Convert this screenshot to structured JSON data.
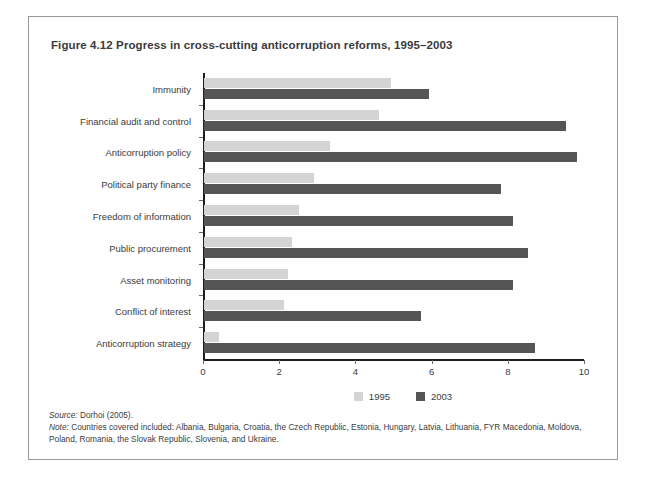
{
  "figure": {
    "title": "Figure 4.12  Progress in cross-cutting anticorruption reforms, 1995–2003",
    "source": "Source:",
    "source_text": " Dorhoi (2005).",
    "note": "Note:",
    "note_text": " Countries covered included: Albania, Bulgaria, Croatia, the Czech Republic, Estonia, Hungary, Latvia, Lithuania, FYR Macedonia, Moldova, Poland, Romania, the Slovak Republic, Slovenia, and Ukraine."
  },
  "colors": {
    "series_1995": "#d4d4d4",
    "series_2003": "#555555",
    "axis": "#1d1d1d",
    "border": "#9a9a9a",
    "text": "#3b3b3b"
  },
  "chart_data": {
    "type": "bar",
    "orientation": "horizontal",
    "title": "Figure 4.12  Progress in cross-cutting anticorruption reforms, 1995–2003",
    "xlabel": "",
    "ylabel": "",
    "xlim": [
      0,
      10
    ],
    "xticks": [
      0,
      2,
      4,
      6,
      8,
      10
    ],
    "xtick_labels": [
      "0",
      "2",
      "4",
      "6",
      "8",
      "10"
    ],
    "grid": false,
    "legend_position": "bottom-center",
    "categories": [
      "Immunity",
      "Financial audit and control",
      "Anticorruption policy",
      "Political party finance",
      "Freedom of information",
      "Public procurement",
      "Asset monitoring",
      "Conflict of interest",
      "Anticorruption strategy"
    ],
    "series": [
      {
        "name": "1995",
        "color": "#d4d4d4",
        "values": [
          4.9,
          4.6,
          3.3,
          2.9,
          2.5,
          2.3,
          2.2,
          2.1,
          0.4
        ]
      },
      {
        "name": "2003",
        "color": "#555555",
        "values": [
          5.9,
          9.5,
          9.8,
          7.8,
          8.1,
          8.5,
          8.1,
          5.7,
          8.7
        ]
      }
    ]
  }
}
